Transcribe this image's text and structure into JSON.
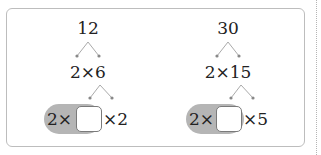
{
  "problems": [
    {
      "number": "12",
      "first_factorization": "2×6",
      "expression_left": "2×",
      "expression_right": "×2",
      "blank": ""
    },
    {
      "number": "30",
      "first_factorization": "2×15",
      "expression_left": "2×",
      "expression_right": "×5",
      "blank": ""
    }
  ],
  "colors": {
    "frame_border": "#bdbdbd",
    "pill_fill": "#b5b5b5",
    "branch_line": "#aaaaaa",
    "branch_dot": "#888888"
  }
}
